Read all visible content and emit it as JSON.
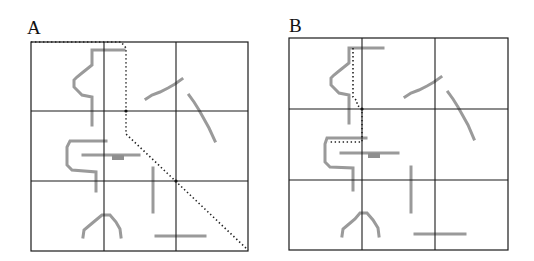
{
  "figure": {
    "panels": [
      {
        "id": "A",
        "label": "A",
        "label_pos": [
          27,
          18
        ],
        "box": {
          "x": 31,
          "y": 42,
          "w": 217,
          "h": 209
        },
        "grid_x": [
          104,
          176
        ],
        "grid_y": [
          111,
          181
        ],
        "strokes": [
          {
            "name": "stroke-zigzag-top-left",
            "points": [
              [
                124,
                50
              ],
              [
                92,
                50
              ],
              [
                92,
                65
              ],
              [
                87,
                69
              ],
              [
                82,
                73
              ],
              [
                77,
                77
              ],
              [
                74,
                80
              ],
              [
                74,
                87
              ],
              [
                78,
                91
              ],
              [
                82,
                95
              ],
              [
                92,
                97
              ],
              [
                92,
                125
              ]
            ]
          },
          {
            "name": "stroke-rising-diagonal",
            "points": [
              [
                146,
                99
              ],
              [
                152,
                95
              ],
              [
                160,
                92
              ],
              [
                168,
                88
              ],
              [
                175,
                84
              ],
              [
                182,
                79
              ]
            ]
          },
          {
            "name": "stroke-falling-diagonal",
            "points": [
              [
                189,
                95
              ],
              [
                194,
                102
              ],
              [
                199,
                110
              ],
              [
                204,
                119
              ],
              [
                209,
                128
              ],
              [
                215,
                141
              ]
            ]
          },
          {
            "name": "stroke-c-shape",
            "points": [
              [
                106,
                141
              ],
              [
                70,
                141
              ],
              [
                67,
                147
              ],
              [
                67,
                165
              ],
              [
                72,
                170
              ],
              [
                96,
                172
              ],
              [
                96,
                191
              ]
            ]
          },
          {
            "name": "stroke-horizontal-middle",
            "points": [
              [
                83,
                155
              ],
              [
                139,
                155
              ]
            ],
            "bump": {
              "x": 112,
              "y": 155,
              "w": 12,
              "h": 5
            }
          },
          {
            "name": "stroke-vertical",
            "points": [
              [
                153,
                168
              ],
              [
                153,
                212
              ]
            ]
          },
          {
            "name": "stroke-arch",
            "points": [
              [
                83,
                237
              ],
              [
                84,
                230
              ],
              [
                90,
                225
              ],
              [
                96,
                220
              ],
              [
                102,
                215
              ],
              [
                110,
                215
              ],
              [
                116,
                222
              ],
              [
                120,
                229
              ],
              [
                121,
                237
              ]
            ]
          },
          {
            "name": "stroke-horizontal-bottom",
            "points": [
              [
                156,
                236
              ],
              [
                205,
                236
              ]
            ]
          }
        ],
        "dotted_path": [
          [
            31,
            42
          ],
          [
            121,
            42
          ],
          [
            126,
            48
          ],
          [
            126,
            134
          ],
          [
            248,
            250
          ]
        ],
        "nodes": [
          [
            126,
            111
          ],
          [
            176,
            181
          ]
        ]
      },
      {
        "id": "B",
        "label": "B",
        "label_pos": [
          289,
          16
        ],
        "box": {
          "x": 289,
          "y": 38,
          "w": 219,
          "h": 212
        },
        "grid_x": [
          362,
          435
        ],
        "grid_y": [
          109,
          180
        ],
        "strokes": [
          {
            "name": "stroke-zigzag-top-left",
            "points": [
              [
                383,
                48
              ],
              [
                349,
                48
              ],
              [
                349,
                63
              ],
              [
                344,
                67
              ],
              [
                339,
                71
              ],
              [
                334,
                75
              ],
              [
                331,
                78
              ],
              [
                331,
                85
              ],
              [
                335,
                89
              ],
              [
                339,
                93
              ],
              [
                349,
                95
              ],
              [
                349,
                123
              ]
            ]
          },
          {
            "name": "stroke-rising-diagonal",
            "points": [
              [
                405,
                97
              ],
              [
                411,
                93
              ],
              [
                419,
                90
              ],
              [
                427,
                86
              ],
              [
                434,
                82
              ],
              [
                441,
                77
              ]
            ]
          },
          {
            "name": "stroke-falling-diagonal",
            "points": [
              [
                448,
                92
              ],
              [
                453,
                99
              ],
              [
                458,
                107
              ],
              [
                463,
                116
              ],
              [
                468,
                125
              ],
              [
                474,
                139
              ]
            ]
          },
          {
            "name": "stroke-c-shape",
            "points": [
              [
                366,
                138
              ],
              [
                327,
                138
              ],
              [
                325,
                144
              ],
              [
                325,
                162
              ],
              [
                330,
                167
              ],
              [
                353,
                168
              ],
              [
                353,
                190
              ]
            ]
          },
          {
            "name": "stroke-horizontal-middle",
            "points": [
              [
                341,
                153
              ],
              [
                398,
                153
              ]
            ],
            "bump": {
              "x": 368,
              "y": 153,
              "w": 12,
              "h": 5
            }
          },
          {
            "name": "stroke-vertical",
            "points": [
              [
                411,
                167
              ],
              [
                411,
                212
              ]
            ]
          },
          {
            "name": "stroke-arch",
            "points": [
              [
                342,
                236
              ],
              [
                343,
                229
              ],
              [
                349,
                224
              ],
              [
                355,
                219
              ],
              [
                360,
                213
              ],
              [
                367,
                213
              ],
              [
                373,
                220
              ],
              [
                378,
                228
              ],
              [
                379,
                236
              ]
            ]
          },
          {
            "name": "stroke-horizontal-bottom",
            "points": [
              [
                415,
                234
              ],
              [
                465,
                234
              ]
            ]
          }
        ],
        "dotted_path": [
          [
            353,
            48
          ],
          [
            353,
            97
          ],
          [
            357,
            101
          ],
          [
            357,
            105
          ],
          [
            362,
            109
          ],
          [
            362,
            142
          ],
          [
            328,
            142
          ]
        ],
        "nodes": [
          [
            362,
            109
          ]
        ]
      }
    ]
  }
}
